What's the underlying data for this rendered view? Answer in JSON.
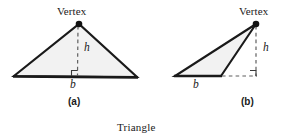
{
  "figure": {
    "caption": "Triangle",
    "panels": [
      {
        "id": "a",
        "caption": "(a)",
        "vertex_label": "Vertex",
        "height_label": "h",
        "base_label": "b",
        "type": "acute-triangle",
        "geometry": {
          "apex": [
            79,
            24
          ],
          "base_left": [
            14,
            76
          ],
          "base_right": [
            137,
            77
          ],
          "foot": [
            77,
            76
          ],
          "altitude_inside": true
        }
      },
      {
        "id": "b",
        "caption": "(b)",
        "vertex_label": "Vertex",
        "height_label": "h",
        "base_label": "b",
        "type": "obtuse-triangle",
        "geometry": {
          "apex": [
            256,
            24
          ],
          "base_left": [
            175,
            76
          ],
          "base_right": [
            221,
            76
          ],
          "foot": [
            256,
            76
          ],
          "altitude_inside": false,
          "base_extension": [
            [
              221,
              76
            ],
            [
              256,
              76
            ]
          ]
        }
      }
    ]
  },
  "colors": {
    "stroke": "#1a1a1a",
    "fill": "#f2f2f2",
    "dashed": "#7a7a7a",
    "text": "#1a1a1a",
    "background": "#ffffff"
  }
}
